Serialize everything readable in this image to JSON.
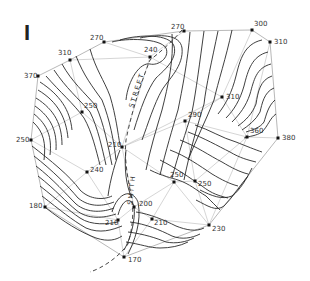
{
  "figure": {
    "label": "I",
    "type": "contour-map",
    "street_label": "STREET",
    "street_label_lower": "SMITH"
  },
  "points": [
    {
      "id": "p370a",
      "value": "370",
      "x": 38,
      "y": 76,
      "lx": -14,
      "ly": 2
    },
    {
      "id": "p310a",
      "value": "310",
      "x": 70,
      "y": 60,
      "lx": -12,
      "ly": -5
    },
    {
      "id": "p270a",
      "value": "270",
      "x": 104,
      "y": 42,
      "lx": -14,
      "ly": -2
    },
    {
      "id": "p240",
      "value": "240",
      "x": 150,
      "y": 57,
      "lx": -6,
      "ly": -5
    },
    {
      "id": "p270b",
      "value": "270",
      "x": 184,
      "y": 31,
      "lx": -13,
      "ly": -2
    },
    {
      "id": "p300",
      "value": "300",
      "x": 252,
      "y": 30,
      "lx": 2,
      "ly": -4
    },
    {
      "id": "p310b",
      "value": "310",
      "x": 270,
      "y": 42,
      "lx": 4,
      "ly": 2
    },
    {
      "id": "p250a",
      "value": "250",
      "x": 82,
      "y": 112,
      "lx": 2,
      "ly": -4
    },
    {
      "id": "p310c",
      "value": "310",
      "x": 222,
      "y": 97,
      "lx": 4,
      "ly": 2
    },
    {
      "id": "p290",
      "value": "290",
      "x": 185,
      "y": 121,
      "lx": 3,
      "ly": -4
    },
    {
      "id": "p360",
      "value": "360",
      "x": 247,
      "y": 137,
      "lx": 3,
      "ly": -4
    },
    {
      "id": "p380",
      "value": "380",
      "x": 278,
      "y": 138,
      "lx": 4,
      "ly": 2
    },
    {
      "id": "p250b",
      "value": "250",
      "x": 31,
      "y": 140,
      "lx": -15,
      "ly": 2
    },
    {
      "id": "p210a",
      "value": "210",
      "x": 122,
      "y": 147,
      "lx": -14,
      "ly": 0
    },
    {
      "id": "p240b",
      "value": "240",
      "x": 87,
      "y": 172,
      "lx": 3,
      "ly": 0
    },
    {
      "id": "p250c",
      "value": "250",
      "x": 174,
      "y": 182,
      "lx": -4,
      "ly": -5
    },
    {
      "id": "p250d",
      "value": "250",
      "x": 195,
      "y": 181,
      "lx": 3,
      "ly": 5
    },
    {
      "id": "p180",
      "value": "180",
      "x": 45,
      "y": 207,
      "lx": -16,
      "ly": 1
    },
    {
      "id": "p200",
      "value": "200",
      "x": 134,
      "y": 207,
      "lx": 5,
      "ly": -1
    },
    {
      "id": "p210b",
      "value": "210",
      "x": 118,
      "y": 220,
      "lx": -13,
      "ly": 5
    },
    {
      "id": "p210c",
      "value": "210",
      "x": 152,
      "y": 219,
      "lx": 2,
      "ly": 6
    },
    {
      "id": "p230",
      "value": "230",
      "x": 209,
      "y": 225,
      "lx": 3,
      "ly": 6
    },
    {
      "id": "p170",
      "value": "170",
      "x": 124,
      "y": 257,
      "lx": 4,
      "ly": 5
    }
  ],
  "colors": {
    "contour": "#2a2a2a",
    "triangulation": "#b8b8b8",
    "point": "#111111",
    "background": "#ffffff"
  }
}
